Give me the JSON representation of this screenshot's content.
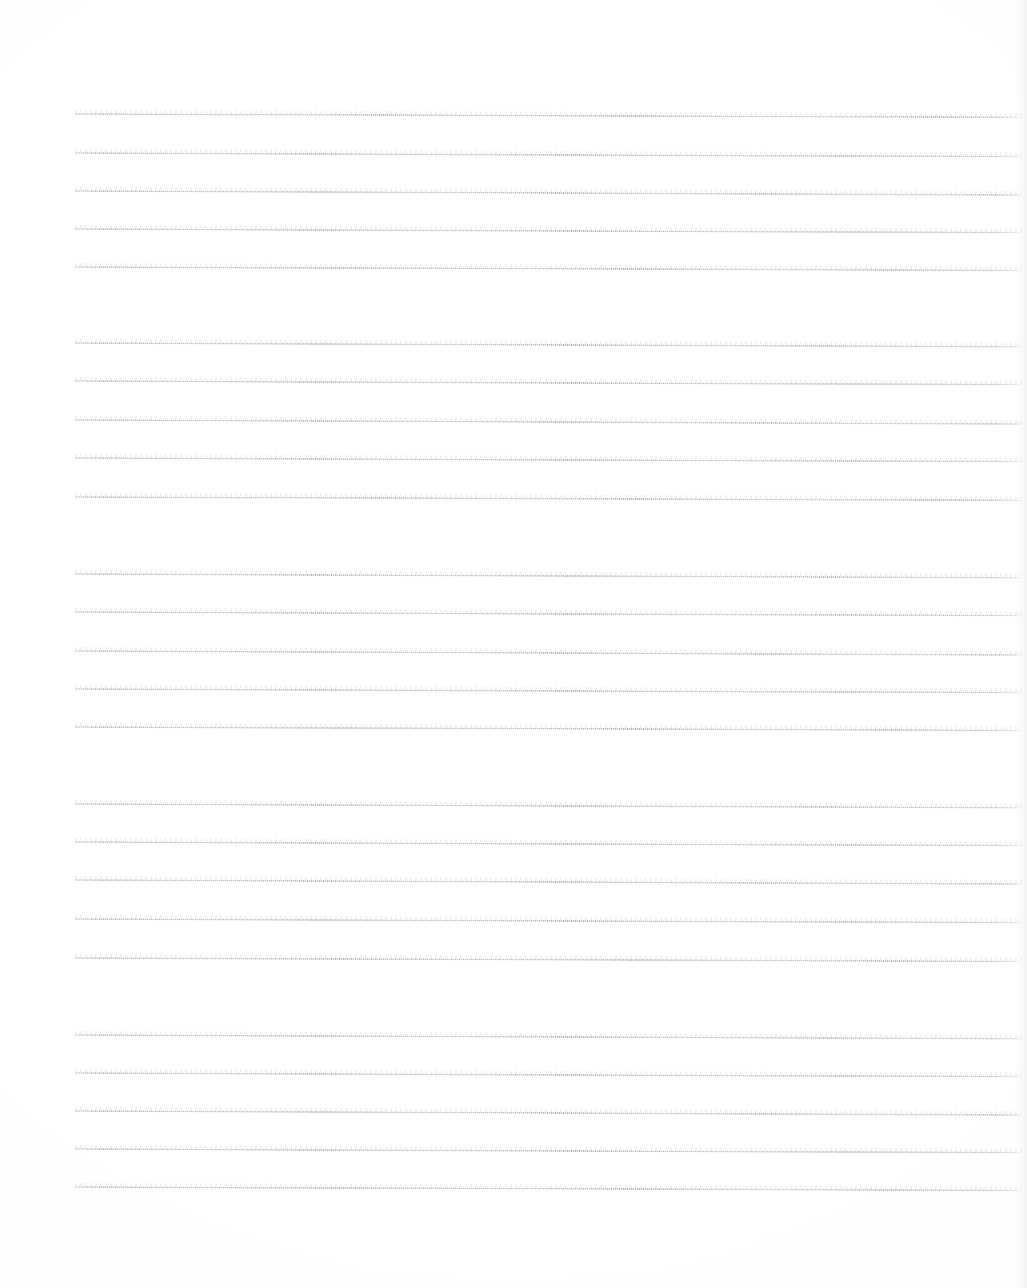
{
  "document": {
    "kind": "scanned-lined-paper",
    "title": "Blank ruled notebook page (scan)",
    "page_width": 1027,
    "page_height": 1288,
    "background_color": "#ffffff",
    "rule_color": "#8a8c92",
    "content_text": "",
    "visible_text": [],
    "margins": {
      "left": 75,
      "right": 1022,
      "top": 113,
      "bottom": 1186
    },
    "ruling": {
      "line_count": 24,
      "group_count": 5,
      "lines_per_group": 5,
      "line_spacing_px": 38.4,
      "group_gap_px": 76,
      "line_thickness_px": 2,
      "tilt_deg": 0.22
    },
    "lines": [
      {
        "id": "rule-1",
        "group": 1,
        "index_in_group": 1,
        "x": 75,
        "y": 113,
        "width": 947,
        "tilt": 0.2
      },
      {
        "id": "rule-2",
        "group": 1,
        "index_in_group": 2,
        "x": 75,
        "y": 152,
        "width": 947,
        "tilt": 0.22
      },
      {
        "id": "rule-3",
        "group": 1,
        "index_in_group": 3,
        "x": 75,
        "y": 190,
        "width": 947,
        "tilt": 0.24
      },
      {
        "id": "rule-4",
        "group": 1,
        "index_in_group": 4,
        "x": 75,
        "y": 228,
        "width": 947,
        "tilt": 0.22
      },
      {
        "id": "rule-5",
        "group": 1,
        "index_in_group": 5,
        "x": 75,
        "y": 266,
        "width": 947,
        "tilt": 0.21
      },
      {
        "id": "rule-6",
        "group": 2,
        "index_in_group": 1,
        "x": 75,
        "y": 342,
        "width": 947,
        "tilt": 0.23
      },
      {
        "id": "rule-7",
        "group": 2,
        "index_in_group": 2,
        "x": 75,
        "y": 380,
        "width": 947,
        "tilt": 0.22
      },
      {
        "id": "rule-8",
        "group": 2,
        "index_in_group": 3,
        "x": 75,
        "y": 419,
        "width": 947,
        "tilt": 0.24
      },
      {
        "id": "rule-9",
        "group": 2,
        "index_in_group": 4,
        "x": 75,
        "y": 457,
        "width": 947,
        "tilt": 0.22
      },
      {
        "id": "rule-10",
        "group": 2,
        "index_in_group": 5,
        "x": 75,
        "y": 496,
        "width": 947,
        "tilt": 0.2
      },
      {
        "id": "rule-11",
        "group": 3,
        "index_in_group": 1,
        "x": 75,
        "y": 573,
        "width": 947,
        "tilt": 0.23
      },
      {
        "id": "rule-12",
        "group": 3,
        "index_in_group": 2,
        "x": 75,
        "y": 611,
        "width": 947,
        "tilt": 0.22
      },
      {
        "id": "rule-13",
        "group": 3,
        "index_in_group": 3,
        "x": 75,
        "y": 650,
        "width": 947,
        "tilt": 0.24
      },
      {
        "id": "rule-14",
        "group": 3,
        "index_in_group": 4,
        "x": 75,
        "y": 688,
        "width": 947,
        "tilt": 0.22
      },
      {
        "id": "rule-15",
        "group": 3,
        "index_in_group": 5,
        "x": 75,
        "y": 726,
        "width": 947,
        "tilt": 0.21
      },
      {
        "id": "rule-16",
        "group": 4,
        "index_in_group": 1,
        "x": 75,
        "y": 803,
        "width": 947,
        "tilt": 0.23
      },
      {
        "id": "rule-17",
        "group": 4,
        "index_in_group": 2,
        "x": 75,
        "y": 841,
        "width": 947,
        "tilt": 0.22
      },
      {
        "id": "rule-18",
        "group": 4,
        "index_in_group": 3,
        "x": 75,
        "y": 879,
        "width": 947,
        "tilt": 0.24
      },
      {
        "id": "rule-19",
        "group": 4,
        "index_in_group": 4,
        "x": 75,
        "y": 918,
        "width": 947,
        "tilt": 0.22
      },
      {
        "id": "rule-20",
        "group": 4,
        "index_in_group": 5,
        "x": 75,
        "y": 957,
        "width": 947,
        "tilt": 0.21
      },
      {
        "id": "rule-21",
        "group": 5,
        "index_in_group": 1,
        "x": 75,
        "y": 1034,
        "width": 947,
        "tilt": 0.23
      },
      {
        "id": "rule-22",
        "group": 5,
        "index_in_group": 2,
        "x": 75,
        "y": 1072,
        "width": 947,
        "tilt": 0.22
      },
      {
        "id": "rule-23",
        "group": 5,
        "index_in_group": 3,
        "x": 75,
        "y": 1110,
        "width": 947,
        "tilt": 0.24
      },
      {
        "id": "rule-24",
        "group": 5,
        "index_in_group": 4,
        "x": 75,
        "y": 1148,
        "width": 947,
        "tilt": 0.22
      },
      {
        "id": "rule-25",
        "group": 5,
        "index_in_group": 5,
        "x": 75,
        "y": 1186,
        "width": 947,
        "tilt": 0.21
      }
    ]
  }
}
